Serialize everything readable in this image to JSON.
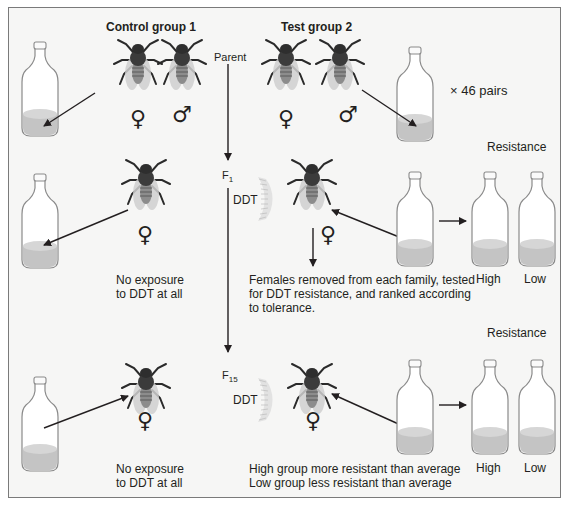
{
  "headers": {
    "control": "Control group 1",
    "test": "Test group 2"
  },
  "generations": {
    "parent": "Parent",
    "f1_base": "F",
    "f1_sub": "1",
    "f15_base": "F",
    "f15_sub": "15"
  },
  "labels": {
    "pairs": "× 46 pairs",
    "ddt_f1": "DDT",
    "ddt_f15": "DDT",
    "resistance_f1": "Resistance",
    "resistance_f15": "Resistance",
    "high_f1": "High",
    "low_f1": "Low",
    "high_f15": "High",
    "low_f15": "Low"
  },
  "captions": {
    "control_f1_line1": "No exposure",
    "control_f1_line2": "to DDT at all",
    "control_f15_line1": "No exposure",
    "control_f15_line2": "to DDT at all",
    "test_f1_line1": "Females removed from each family, tested",
    "test_f1_line2": "for DDT resistance, and ranked according",
    "test_f1_line3": "to tolerance.",
    "test_f15_line1": "High group more resistant than average",
    "test_f15_line2": "Low group less resistant than average"
  },
  "symbols": {
    "female": "♀",
    "male": "♂"
  },
  "colors": {
    "background": "#f6f6f5",
    "frame": "#7a7a7a",
    "fly_body": "#3b3b3b",
    "fly_wing": "#cfcfcf",
    "medium": "#c8c8c8",
    "ink": "#231f20"
  }
}
